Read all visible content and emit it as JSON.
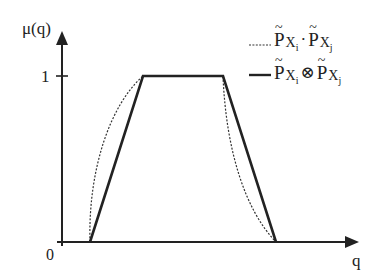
{
  "diagram": {
    "y_axis": {
      "label": "μ(q)",
      "ticks": [
        {
          "value": "0",
          "y_px": 242
        },
        {
          "value": "1",
          "y_px": 76
        }
      ]
    },
    "x_axis": {
      "label": "q"
    },
    "colors": {
      "ink": "#222222",
      "background": "#ffffff"
    },
    "series": [
      {
        "name": "product",
        "style": "dotted",
        "legend": {
          "symbol": "P",
          "subscript_a": "X",
          "subsub_a": "i",
          "operator": "·",
          "subscript_b": "X",
          "subsub_b": "j",
          "tilde": "~"
        },
        "shape": "curved trapezoid (concave sides)"
      },
      {
        "name": "tensor-product",
        "style": "solid",
        "legend": {
          "symbol": "P",
          "subscript_a": "X",
          "subsub_a": "i",
          "operator": "⊗",
          "subscript_b": "X",
          "subsub_b": "j",
          "tilde": "~"
        },
        "shape": "trapezoid (linear sides)"
      }
    ],
    "trapezoid_points": [
      [
        90,
        242
      ],
      [
        143,
        76
      ],
      [
        223,
        76
      ],
      [
        276,
        242
      ]
    ]
  }
}
